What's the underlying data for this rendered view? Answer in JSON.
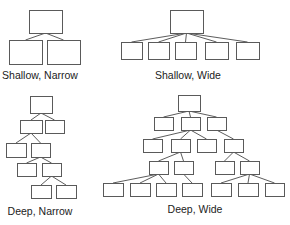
{
  "figure": {
    "diagrams": [
      {
        "id": "shallow-narrow",
        "label": "Shallow, Narrow",
        "label_pos": [
          40,
          79
        ],
        "nodes": [
          {
            "id": "r",
            "x": 29,
            "y": 10,
            "w": 33,
            "h": 23
          },
          {
            "id": "a",
            "x": 9,
            "y": 40,
            "w": 33,
            "h": 24
          },
          {
            "id": "b",
            "x": 47,
            "y": 40,
            "w": 33,
            "h": 24
          }
        ],
        "edges": [
          [
            "r",
            "a"
          ],
          [
            "r",
            "b"
          ]
        ]
      },
      {
        "id": "shallow-wide",
        "label": "Shallow, Wide",
        "label_pos": [
          188,
          79
        ],
        "nodes": [
          {
            "id": "r",
            "x": 170,
            "y": 10,
            "w": 33,
            "h": 23
          },
          {
            "id": "a",
            "x": 121,
            "y": 42,
            "w": 21,
            "h": 17
          },
          {
            "id": "b",
            "x": 148,
            "y": 42,
            "w": 21,
            "h": 17
          },
          {
            "id": "c",
            "x": 175,
            "y": 42,
            "w": 21,
            "h": 17
          },
          {
            "id": "d",
            "x": 205,
            "y": 42,
            "w": 23,
            "h": 17
          },
          {
            "id": "e",
            "x": 236,
            "y": 42,
            "w": 23,
            "h": 17
          }
        ],
        "edges": [
          [
            "r",
            "a"
          ],
          [
            "r",
            "b"
          ],
          [
            "r",
            "c"
          ],
          [
            "r",
            "d"
          ],
          [
            "r",
            "e"
          ]
        ]
      },
      {
        "id": "deep-narrow",
        "label": "Deep, Narrow",
        "label_pos": [
          40,
          215
        ],
        "nodes": [
          {
            "id": "r",
            "x": 30,
            "y": 96,
            "w": 22,
            "h": 17
          },
          {
            "id": "a",
            "x": 20,
            "y": 120,
            "w": 22,
            "h": 13
          },
          {
            "id": "b",
            "x": 45,
            "y": 120,
            "w": 19,
            "h": 13
          },
          {
            "id": "c",
            "x": 6,
            "y": 143,
            "w": 20,
            "h": 14
          },
          {
            "id": "d",
            "x": 31,
            "y": 143,
            "w": 19,
            "h": 14
          },
          {
            "id": "e",
            "x": 17,
            "y": 163,
            "w": 19,
            "h": 13
          },
          {
            "id": "f",
            "x": 42,
            "y": 163,
            "w": 19,
            "h": 13
          },
          {
            "id": "g",
            "x": 31,
            "y": 185,
            "w": 20,
            "h": 13
          },
          {
            "id": "h",
            "x": 56,
            "y": 185,
            "w": 20,
            "h": 13
          }
        ],
        "edges": [
          [
            "r",
            "a"
          ],
          [
            "r",
            "b"
          ],
          [
            "a",
            "c"
          ],
          [
            "a",
            "d"
          ],
          [
            "d",
            "e"
          ],
          [
            "d",
            "f"
          ],
          [
            "f",
            "g"
          ],
          [
            "f",
            "h"
          ]
        ]
      },
      {
        "id": "deep-wide",
        "label": "Deep, Wide",
        "label_pos": [
          195,
          213
        ],
        "nodes": [
          {
            "id": "r",
            "x": 178,
            "y": 95,
            "w": 22,
            "h": 16
          },
          {
            "id": "a",
            "x": 154,
            "y": 117,
            "w": 19,
            "h": 13
          },
          {
            "id": "b",
            "x": 181,
            "y": 117,
            "w": 19,
            "h": 13
          },
          {
            "id": "c",
            "x": 207,
            "y": 117,
            "w": 19,
            "h": 13
          },
          {
            "id": "d",
            "x": 143,
            "y": 139,
            "w": 19,
            "h": 13
          },
          {
            "id": "e",
            "x": 171,
            "y": 139,
            "w": 19,
            "h": 13
          },
          {
            "id": "f",
            "x": 197,
            "y": 139,
            "w": 19,
            "h": 13
          },
          {
            "id": "g",
            "x": 224,
            "y": 139,
            "w": 19,
            "h": 13
          },
          {
            "id": "h",
            "x": 149,
            "y": 161,
            "w": 19,
            "h": 13
          },
          {
            "id": "i",
            "x": 174,
            "y": 161,
            "w": 19,
            "h": 13
          },
          {
            "id": "j",
            "x": 215,
            "y": 161,
            "w": 19,
            "h": 13
          },
          {
            "id": "k",
            "x": 240,
            "y": 161,
            "w": 19,
            "h": 13
          },
          {
            "id": "l",
            "x": 103,
            "y": 183,
            "w": 20,
            "h": 13
          },
          {
            "id": "m",
            "x": 130,
            "y": 183,
            "w": 20,
            "h": 13
          },
          {
            "id": "n",
            "x": 156,
            "y": 183,
            "w": 20,
            "h": 13
          },
          {
            "id": "o",
            "x": 182,
            "y": 183,
            "w": 20,
            "h": 13
          },
          {
            "id": "p",
            "x": 211,
            "y": 183,
            "w": 20,
            "h": 13
          },
          {
            "id": "q",
            "x": 238,
            "y": 183,
            "w": 20,
            "h": 13
          },
          {
            "id": "s",
            "x": 265,
            "y": 183,
            "w": 19,
            "h": 13
          }
        ],
        "edges": [
          [
            "r",
            "a"
          ],
          [
            "r",
            "b"
          ],
          [
            "r",
            "c"
          ],
          [
            "b",
            "d"
          ],
          [
            "b",
            "e"
          ],
          [
            "b",
            "f"
          ],
          [
            "c",
            "g"
          ],
          [
            "e",
            "h"
          ],
          [
            "e",
            "i"
          ],
          [
            "g",
            "j"
          ],
          [
            "g",
            "k"
          ],
          [
            "h",
            "l"
          ],
          [
            "h",
            "m"
          ],
          [
            "h",
            "n"
          ],
          [
            "i",
            "o"
          ],
          [
            "k",
            "p"
          ],
          [
            "k",
            "q"
          ],
          [
            "k",
            "s"
          ]
        ]
      }
    ]
  }
}
